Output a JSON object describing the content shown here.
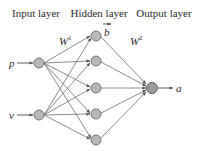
{
  "diagram": {
    "type": "neural-network",
    "layers": {
      "input": {
        "title": "Input layer",
        "nodes": [
          {
            "label": "p"
          },
          {
            "label": "v"
          }
        ]
      },
      "hidden": {
        "title": "Hidden layer",
        "node_count": 5,
        "bias_label": "b"
      },
      "output": {
        "title": "Output layer",
        "node_count": 1,
        "output_label": "a"
      }
    },
    "weights": {
      "w1": {
        "base": "W",
        "sup": "1"
      },
      "w2": {
        "base": "W",
        "sup": "2"
      }
    },
    "colors": {
      "node_fill": "#b8b8b8",
      "output_node_fill": "#9a9a9a",
      "edge": "#6e6e6e",
      "text": "#2a2a2a"
    }
  }
}
